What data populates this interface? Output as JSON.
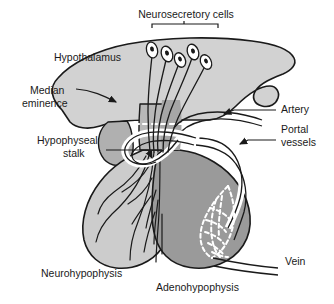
{
  "figure": {
    "background_color": "#ffffff",
    "outline_color": "#1a1a1a",
    "text_color": "#1a1a1a"
  },
  "regions": {
    "hypothalamus": {
      "label": "Hypothalamus",
      "fill": "#d2d2d2"
    },
    "median_eminence": {
      "label": "Median\neminence",
      "line1": "Median",
      "line2": "eminence",
      "fill": "#b0b0b0"
    },
    "hypophyseal_stalk": {
      "label": "Hypophyseal\nstalk",
      "line1": "Hypophyseal",
      "line2": "stalk",
      "fill": "#b8b8b8"
    },
    "neurohypophysis": {
      "label": "Neurohypophysis",
      "fill": "#cccccc"
    },
    "adenohypophysis": {
      "label": "Adenohypophysis",
      "fill": "#9a9a9a"
    }
  },
  "structures": {
    "neurosecretory_cells": {
      "label": "Neurosecretory cells",
      "count": 5,
      "has_bracket": true,
      "cell_fill": "#ffffff",
      "nucleus_fill": "#1a1a1a"
    },
    "artery": {
      "label": "Artery",
      "vessel_fill": "#ffffff"
    },
    "portal_vessels": {
      "label": "Portal\nvessels",
      "line1": "Portal",
      "line2": "vessels",
      "vessel_fill": "#ffffff"
    },
    "vein": {
      "label": "Vein",
      "vessel_fill": "#ffffff"
    },
    "primary_plexus": {
      "style": "white-dashed",
      "color": "#ffffff"
    },
    "secondary_plexus": {
      "style": "white-dashed-network",
      "color": "#ffffff"
    },
    "axon_fibers": {
      "style": "branching-lines",
      "color": "#1a1a1a"
    }
  },
  "labels": [
    {
      "name": "neurosecretory-cells",
      "text": "Neurosecretory cells",
      "x": 186,
      "y": 18,
      "anchor": "middle"
    },
    {
      "name": "hypothalamus",
      "text": "Hypothalamus",
      "x": 54,
      "y": 61,
      "anchor": "start"
    },
    {
      "name": "median-eminence-l1",
      "text": "Median",
      "x": 30,
      "y": 94,
      "anchor": "start"
    },
    {
      "name": "median-eminence-l2",
      "text": "eminence",
      "x": 22,
      "y": 107,
      "anchor": "start"
    },
    {
      "name": "hypophyseal-stalk-l1",
      "text": "Hypophyseal",
      "x": 37,
      "y": 144,
      "anchor": "start"
    },
    {
      "name": "hypophyseal-stalk-l2",
      "text": "stalk",
      "x": 63,
      "y": 157,
      "anchor": "start"
    },
    {
      "name": "artery",
      "text": "Artery",
      "x": 281,
      "y": 113,
      "anchor": "start"
    },
    {
      "name": "portal-vessels-l1",
      "text": "Portal",
      "x": 281,
      "y": 133,
      "anchor": "start"
    },
    {
      "name": "portal-vessels-l2",
      "text": "vessels",
      "x": 281,
      "y": 146,
      "anchor": "start"
    },
    {
      "name": "vein",
      "text": "Vein",
      "x": 285,
      "y": 265,
      "anchor": "start"
    },
    {
      "name": "neurohypophysis",
      "text": "Neurohypophysis",
      "x": 41,
      "y": 277,
      "anchor": "start"
    },
    {
      "name": "adenohypophysis",
      "text": "Adenohypophysis",
      "x": 156,
      "y": 291,
      "anchor": "start"
    }
  ]
}
